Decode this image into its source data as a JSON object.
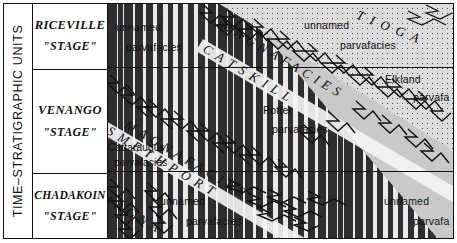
{
  "figure": {
    "axis_title": "TIME–STRATIGRAPHIC UNITS"
  },
  "stages": [
    {
      "name": "RICEVILLE",
      "qualifier": "\"STAGE\""
    },
    {
      "name": "VENANGO",
      "qualifier": "\"STAGE\""
    },
    {
      "name": "CHADAKOIN",
      "qualifier": "\"STAGE\""
    }
  ],
  "parvafacies": [
    {
      "line1": "unnamed",
      "line2": "parvafacies"
    },
    {
      "line1": "unnamed",
      "line2": "parvafacies"
    },
    {
      "line1": "Elkland",
      "line2": "parvafa"
    },
    {
      "line1": "Potter",
      "line2": "parvafacies"
    },
    {
      "line1": "Cattaraugus",
      "line2": "parvafacies"
    },
    {
      "line1": "unnamed",
      "line2": "parvafacies"
    },
    {
      "line1": "unnamed",
      "line2": "parvafa"
    }
  ],
  "magnafacies": {
    "upper": "MAGNAFACIES",
    "middle": "MAGNAFACIES",
    "lower": "MAGNA"
  },
  "formations": {
    "tioga": "TIOGA",
    "catskill": "CATSKILL",
    "smethport": "SMETHPORT"
  },
  "colors": {
    "ink": "#111111",
    "sandstone": "#dcdcdc",
    "shale": "#e9e9e9",
    "grey": "#c9c9c9",
    "band": "#f3f3f3"
  }
}
